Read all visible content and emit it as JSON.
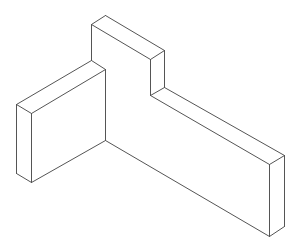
{
  "figure": {
    "type": "isometric line drawing",
    "stroke_color": "#555555",
    "background": "#ffffff",
    "stroke_width": 1
  },
  "edges": [
    {
      "id": "tall-top-left",
      "x1": 91,
      "y1": 24,
      "x2": 105,
      "y2": 15
    },
    {
      "id": "tall-top-back",
      "x1": 105,
      "y1": 15,
      "x2": 164,
      "y2": 50
    },
    {
      "id": "tall-top-front",
      "x1": 91,
      "y1": 24,
      "x2": 150,
      "y2": 59
    },
    {
      "id": "tall-top-right",
      "x1": 150,
      "y1": 59,
      "x2": 164,
      "y2": 50
    },
    {
      "id": "tall-left-vertical",
      "x1": 91,
      "y1": 24,
      "x2": 91,
      "y2": 60
    },
    {
      "id": "tall-front-vertical",
      "x1": 150,
      "y1": 59,
      "x2": 150,
      "y2": 95
    },
    {
      "id": "tall-back-vertical",
      "x1": 164,
      "y1": 50,
      "x2": 164,
      "y2": 87
    },
    {
      "id": "step-right",
      "x1": 150,
      "y1": 95,
      "x2": 164,
      "y2": 87
    },
    {
      "id": "long-top-back",
      "x1": 164,
      "y1": 87,
      "x2": 284,
      "y2": 155
    },
    {
      "id": "long-top-front",
      "x1": 150,
      "y1": 95,
      "x2": 269,
      "y2": 164
    },
    {
      "id": "end-top",
      "x1": 269,
      "y1": 164,
      "x2": 284,
      "y2": 155
    },
    {
      "id": "end-front-vertical",
      "x1": 269,
      "y1": 164,
      "x2": 269,
      "y2": 236
    },
    {
      "id": "end-back-vertical",
      "x1": 284,
      "y1": 155,
      "x2": 284,
      "y2": 226
    },
    {
      "id": "end-bottom",
      "x1": 269,
      "y1": 236,
      "x2": 284,
      "y2": 226
    },
    {
      "id": "long-bottom-front",
      "x1": 105,
      "y1": 140,
      "x2": 269,
      "y2": 236
    },
    {
      "id": "left-top-back",
      "x1": 16,
      "y1": 104,
      "x2": 91,
      "y2": 60
    },
    {
      "id": "left-top-front",
      "x1": 31,
      "y1": 113,
      "x2": 105,
      "y2": 69
    },
    {
      "id": "left-top-left",
      "x1": 16,
      "y1": 104,
      "x2": 31,
      "y2": 113
    },
    {
      "id": "left-top-right",
      "x1": 91,
      "y1": 60,
      "x2": 105,
      "y2": 69
    },
    {
      "id": "left-outer-vertical",
      "x1": 16,
      "y1": 104,
      "x2": 16,
      "y2": 173
    },
    {
      "id": "left-front-vertical",
      "x1": 31,
      "y1": 113,
      "x2": 31,
      "y2": 182
    },
    {
      "id": "left-bottom-left",
      "x1": 16,
      "y1": 173,
      "x2": 31,
      "y2": 182
    },
    {
      "id": "left-bottom-front",
      "x1": 31,
      "y1": 182,
      "x2": 105,
      "y2": 140
    },
    {
      "id": "inner-corner-vertical",
      "x1": 105,
      "y1": 69,
      "x2": 105,
      "y2": 140
    }
  ]
}
